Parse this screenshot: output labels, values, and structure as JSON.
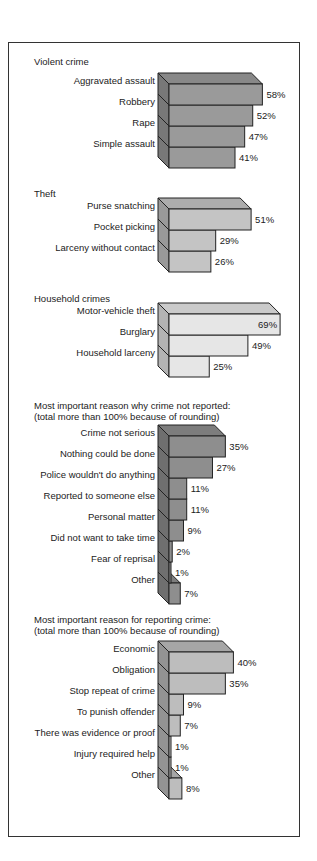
{
  "chart_data": [
    {
      "type": "bar",
      "orientation": "horizontal",
      "style": "3d",
      "title": "Violent crime",
      "categories": [
        "Aggravated assault",
        "Robbery",
        "Rape",
        "Simple assault"
      ],
      "values": [
        58,
        52,
        47,
        41
      ],
      "value_labels": [
        "58%",
        "52%",
        "47%",
        "41%"
      ],
      "unit": "%",
      "color": "#9a9a9a"
    },
    {
      "type": "bar",
      "orientation": "horizontal",
      "style": "3d",
      "title": "Theft",
      "categories": [
        "Purse snatching",
        "Pocket picking",
        "Larceny without contact"
      ],
      "values": [
        51,
        29,
        26
      ],
      "value_labels": [
        "51%",
        "29%",
        "26%"
      ],
      "unit": "%",
      "color": "#c4c4c4"
    },
    {
      "type": "bar",
      "orientation": "horizontal",
      "style": "3d",
      "title": "Household crimes",
      "categories": [
        "Motor-vehicle theft",
        "Burglary",
        "Household larceny"
      ],
      "values": [
        69,
        49,
        25
      ],
      "value_labels": [
        "69%",
        "49%",
        "25%"
      ],
      "unit": "%",
      "color": "#e6e6e6"
    },
    {
      "type": "bar",
      "orientation": "horizontal",
      "style": "3d",
      "title": "Most important reason why crime not reported:\n(total more than 100% because of rounding)",
      "categories": [
        "Crime not serious",
        "Nothing could be done",
        "Police wouldn't do anything",
        "Reported to someone else",
        "Personal matter",
        "Did not want to take time",
        "Fear of reprisal",
        "Other"
      ],
      "values": [
        35,
        27,
        11,
        11,
        9,
        2,
        1,
        7
      ],
      "value_labels": [
        "35%",
        "27%",
        "11%",
        "11%",
        "9%",
        "2%",
        "1%",
        "7%"
      ],
      "unit": "%",
      "color": "#8e8e8e"
    },
    {
      "type": "bar",
      "orientation": "horizontal",
      "style": "3d",
      "title": "Most important reason for reporting crime:\n(total more than 100% because of rounding)",
      "categories": [
        "Economic",
        "Obligation",
        "Stop repeat of crime",
        "To punish offender",
        "There was evidence or proof",
        "Injury required help",
        "Other"
      ],
      "values": [
        40,
        35,
        9,
        7,
        1,
        1,
        8
      ],
      "value_labels": [
        "40%",
        "35%",
        "9%",
        "7%",
        "1%",
        "1%",
        "8%"
      ],
      "unit": "%",
      "color": "#bdbdbd"
    }
  ],
  "layout": {
    "groups": [
      {
        "title_y": 56,
        "bars_top": 84,
        "row_h": 21
      },
      {
        "title_y": 188,
        "bars_top": 209,
        "row_h": 21
      },
      {
        "title_y": 293,
        "bars_top": 314,
        "row_h": 21
      },
      {
        "title_y": 400,
        "bars_top": 436,
        "row_h": 21
      },
      {
        "title_y": 614,
        "bars_top": 652,
        "row_h": 21
      }
    ]
  }
}
